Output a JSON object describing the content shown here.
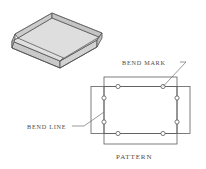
{
  "drawing": {
    "title_caption": "PATTERN",
    "labels": {
      "bend_mark": "BEND MARK",
      "bend_line": "BEND LINE"
    },
    "colors": {
      "background": "#ffffff",
      "line": "#5c5c5c",
      "text": "#4a4a4a",
      "face_top_rim": "#d9d9d9",
      "face_outer_wall": "#cfcfcf",
      "face_inner_wall": "#c2c2c2",
      "face_floor": "#dcdcdc",
      "face_bottom_edge": "#b8b8b8"
    },
    "isometric_box": {
      "name": "sheet-metal-tray",
      "description": "open rectangular tray shown in isometric view"
    },
    "pattern": {
      "name": "flat-pattern",
      "description": "cross-shaped flat blank formed by two overlapping rectangles",
      "bend_mark_count": 8,
      "bend_marks": [
        {
          "id": "bm-top-left",
          "cx": 118,
          "cy": 86.5
        },
        {
          "id": "bm-top-right",
          "cx": 163,
          "cy": 86.5
        },
        {
          "id": "bm-left-upper",
          "cx": 104,
          "cy": 98
        },
        {
          "id": "bm-right-upper",
          "cx": 177,
          "cy": 98
        },
        {
          "id": "bm-left-lower",
          "cx": 104,
          "cy": 122
        },
        {
          "id": "bm-right-lower",
          "cx": 177,
          "cy": 122
        },
        {
          "id": "bm-bottom-left",
          "cx": 118,
          "cy": 133.5
        },
        {
          "id": "bm-bottom-right",
          "cx": 163,
          "cy": 133.5
        }
      ]
    }
  }
}
